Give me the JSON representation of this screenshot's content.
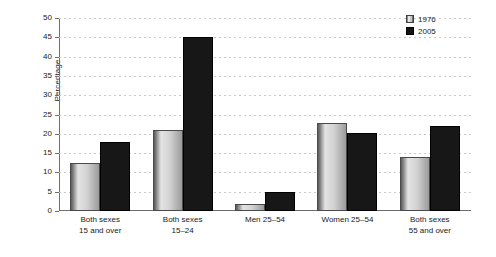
{
  "chart_data": {
    "type": "bar",
    "title": "",
    "xlabel": "",
    "ylabel": "Percentage",
    "ylim": [
      0,
      50
    ],
    "ytick_step": 5,
    "yticks": [
      50,
      45,
      40,
      35,
      30,
      25,
      20,
      15,
      10,
      5,
      0
    ],
    "grid": true,
    "grid_style": "dotted-horizontal",
    "legend_position": "top-right",
    "categories": [
      [
        "Both sexes",
        "15 and over"
      ],
      [
        "Both sexes",
        "15–24"
      ],
      [
        "Men 25–54"
      ],
      [
        "Women 25–54"
      ],
      [
        "Both sexes",
        "55 and over"
      ]
    ],
    "series": [
      {
        "name": "1976",
        "color": "#c8c8c8",
        "values": [
          12.5,
          21.0,
          1.7,
          22.7,
          14.0
        ]
      },
      {
        "name": "2005",
        "color": "#171717",
        "values": [
          18.0,
          45.0,
          5.0,
          20.3,
          22.0
        ]
      }
    ]
  },
  "legend": {
    "items": [
      {
        "label": "1976",
        "swatch": "gray-gradient-swatch"
      },
      {
        "label": "2005",
        "swatch": "black-swatch"
      }
    ]
  }
}
